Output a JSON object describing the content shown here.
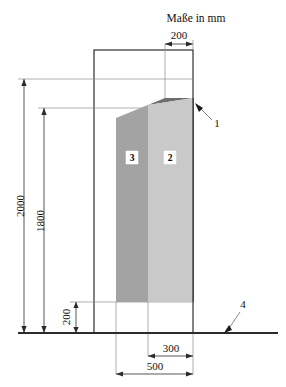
{
  "figure": {
    "units_note": "Maße in mm",
    "caption": "",
    "colors": {
      "region3_fill": "#a3a3a3",
      "region2_fill": "#c9c9c9",
      "slope_face_fill": "#6e6e6e",
      "outline_stroke": "#1a1a1a",
      "thin_stroke": "#8c8c8c",
      "ground_stroke": "#2b2b2b"
    },
    "dimensions": [
      {
        "id": "dim-top-200",
        "label": "200",
        "orientation": "horizontal",
        "position": "top"
      },
      {
        "id": "dim-left-2000",
        "label": "2000",
        "orientation": "vertical",
        "position": "left-outer"
      },
      {
        "id": "dim-left-1800",
        "label": "1800",
        "orientation": "vertical",
        "position": "left-inner"
      },
      {
        "id": "dim-bottom-200",
        "label": "200",
        "orientation": "vertical",
        "position": "bottom-left"
      },
      {
        "id": "dim-bottom-300",
        "label": "300",
        "orientation": "horizontal",
        "position": "bottom-inner"
      },
      {
        "id": "dim-bottom-500",
        "label": "500",
        "orientation": "horizontal",
        "position": "bottom-outer"
      }
    ],
    "part_labels": [
      {
        "id": "part-3",
        "label": "3"
      },
      {
        "id": "part-2",
        "label": "2"
      }
    ],
    "callouts": [
      {
        "id": "callout-1",
        "label": "1"
      },
      {
        "id": "callout-4",
        "label": "4"
      }
    ]
  }
}
